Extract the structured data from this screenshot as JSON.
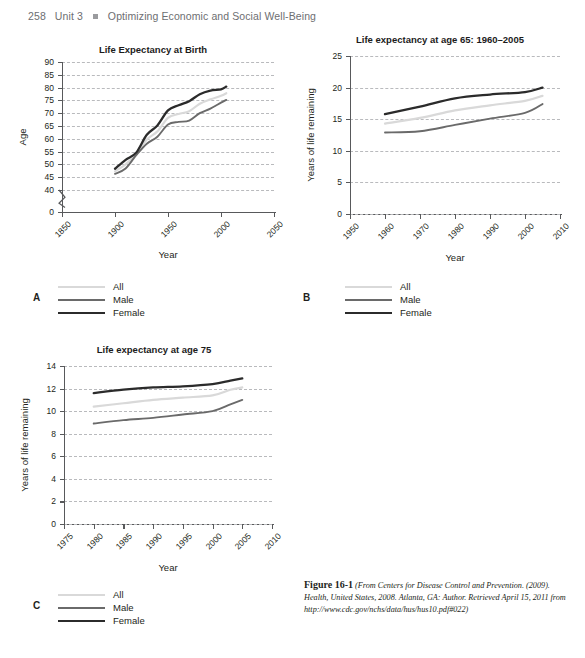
{
  "running_head": {
    "folio": "258",
    "unit": "Unit 3",
    "bullet": "square-bullet",
    "title": "Optimizing Economic and Social Well-Being"
  },
  "legend_labels": {
    "all": "All",
    "male": "Male",
    "female": "Female"
  },
  "colors": {
    "all": "#d9d9d9",
    "male": "#6a6a6a",
    "female": "#2b2b2b",
    "grid": "#b9babd",
    "axis": "#58595b",
    "text": "#231f20",
    "runhead": "#6d6e71"
  },
  "panels": {
    "a": "A",
    "b": "B",
    "c": "C"
  },
  "caption": {
    "figure_number": "Figure 16-1",
    "source": "(From Centers for Disease Control and Prevention. (2009). Health, United States, 2008. Atlanta, GA: Author. Retrieved April 15, 2011 from http://www.cdc.gov/nchs/data/hus/hus10.pdf#022)"
  },
  "chart_data": [
    {
      "id": "A",
      "type": "line",
      "title": "Life Expectancy at Birth",
      "xlabel": "Year",
      "ylabel": "Age",
      "xlim": [
        1850,
        2050
      ],
      "ylim": [
        40,
        90
      ],
      "y_axis_break": true,
      "y_break_from": 0,
      "y_break_to": 40,
      "yticks": [
        0,
        40,
        45,
        50,
        55,
        60,
        65,
        70,
        75,
        80,
        85,
        90
      ],
      "ytick_labels": [
        "0",
        "40",
        "45",
        "50",
        "55",
        "60",
        "65",
        "70",
        "75",
        "80",
        "85",
        "90"
      ],
      "xticks": [
        1850,
        1900,
        1950,
        2000,
        2050
      ],
      "xtick_labels": [
        "1850",
        "1900",
        "1950",
        "2000",
        "2050"
      ],
      "grid": true,
      "legend_position": "below-left",
      "x": [
        1900,
        1910,
        1920,
        1930,
        1940,
        1950,
        1960,
        1970,
        1980,
        1990,
        2000,
        2005
      ],
      "series": [
        {
          "name": "All",
          "values": [
            47.3,
            50.0,
            54.1,
            59.7,
            62.9,
            68.2,
            69.7,
            70.8,
            73.7,
            75.4,
            76.8,
            77.8
          ]
        },
        {
          "name": "Male",
          "values": [
            46.3,
            48.4,
            53.6,
            58.1,
            60.8,
            65.6,
            66.6,
            67.1,
            70.0,
            71.8,
            74.1,
            75.2
          ]
        },
        {
          "name": "Female",
          "values": [
            48.3,
            51.8,
            54.6,
            61.6,
            65.2,
            71.1,
            73.1,
            74.7,
            77.4,
            78.8,
            79.3,
            80.4
          ]
        }
      ]
    },
    {
      "id": "B",
      "type": "line",
      "title": "Life expectancy at age 65: 1960–2005",
      "xlabel": "Year",
      "ylabel": "Years of life remaining",
      "xlim": [
        1950,
        2010
      ],
      "ylim": [
        0,
        25
      ],
      "yticks": [
        0,
        5,
        10,
        15,
        20,
        25
      ],
      "ytick_labels": [
        "0",
        "5",
        "10",
        "15",
        "20",
        "25"
      ],
      "xticks": [
        1950,
        1960,
        1970,
        1980,
        1990,
        2000,
        2010
      ],
      "xtick_labels": [
        "1950",
        "1960",
        "1970",
        "1980",
        "1990",
        "2000",
        "2010"
      ],
      "grid": true,
      "legend_position": "below-left",
      "x": [
        1960,
        1970,
        1980,
        1990,
        2000,
        2005
      ],
      "series": [
        {
          "name": "All",
          "values": [
            14.3,
            15.2,
            16.4,
            17.2,
            17.9,
            18.7
          ]
        },
        {
          "name": "Male",
          "values": [
            12.9,
            13.1,
            14.1,
            15.1,
            16.0,
            17.4
          ]
        },
        {
          "name": "Female",
          "values": [
            15.8,
            17.0,
            18.3,
            18.9,
            19.3,
            20.0
          ]
        }
      ]
    },
    {
      "id": "C",
      "type": "line",
      "title": "Life expectancy at age 75",
      "xlabel": "Year",
      "ylabel": "Years of life remaining",
      "xlim": [
        1975,
        2010
      ],
      "ylim": [
        0,
        14
      ],
      "yticks": [
        0,
        2,
        4,
        6,
        8,
        10,
        12,
        14
      ],
      "ytick_labels": [
        "0",
        "2",
        "4",
        "6",
        "8",
        "10",
        "12",
        "14"
      ],
      "xticks": [
        1975,
        1980,
        1985,
        1990,
        1995,
        2000,
        2005,
        2010
      ],
      "xtick_labels": [
        "1975",
        "1980",
        "1985",
        "1990",
        "1995",
        "2000",
        "2005",
        "2010"
      ],
      "grid": true,
      "legend_position": "below-left",
      "x": [
        1980,
        1985,
        1990,
        1995,
        2000,
        2003,
        2005
      ],
      "series": [
        {
          "name": "All",
          "values": [
            10.4,
            10.7,
            11.0,
            11.2,
            11.4,
            11.9,
            12.1
          ]
        },
        {
          "name": "Male",
          "values": [
            8.9,
            9.2,
            9.4,
            9.7,
            10.0,
            10.6,
            11.0
          ]
        },
        {
          "name": "Female",
          "values": [
            11.6,
            11.9,
            12.1,
            12.2,
            12.4,
            12.7,
            12.9
          ]
        }
      ]
    }
  ]
}
